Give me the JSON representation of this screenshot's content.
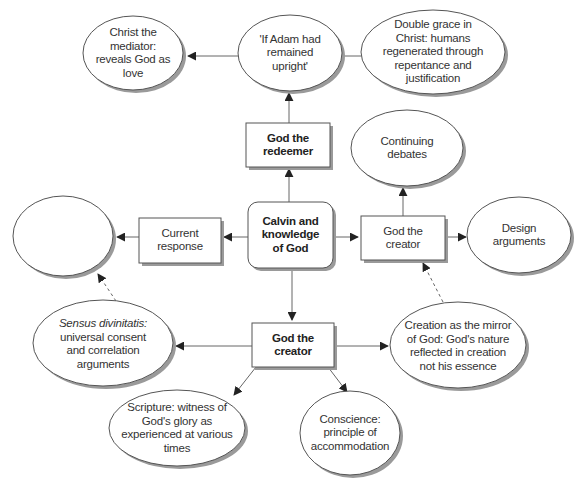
{
  "diagram": {
    "center": {
      "id": "calvin",
      "label": "Calvin and knowledge of God",
      "shape": "rounded-box",
      "bold": true
    },
    "nodes": [
      {
        "id": "redeemer",
        "label": "God the redeemer",
        "shape": "box",
        "bold": true
      },
      {
        "id": "creator",
        "label": "God the creator",
        "shape": "box",
        "bold": true
      },
      {
        "id": "current",
        "label": "Current response",
        "shape": "box"
      },
      {
        "id": "continuing",
        "label": "Continuing debates",
        "shape": "box"
      },
      {
        "id": "mediator",
        "label": "Christ the mediator: reveals God as love",
        "shape": "ellipse"
      },
      {
        "id": "adam",
        "label": "'If Adam had remained upright'",
        "shape": "ellipse"
      },
      {
        "id": "double_grace",
        "label": "Double grace in Christ: humans regenerated through repentance and justification",
        "shape": "ellipse"
      },
      {
        "id": "barth",
        "label": "Barth–Brunner debate",
        "shape": "ellipse"
      },
      {
        "id": "reformed",
        "label": "Reformed epistemology: basic beliefs",
        "shape": "ellipse"
      },
      {
        "id": "design",
        "label": "Design arguments",
        "shape": "ellipse"
      },
      {
        "id": "sensus",
        "label_italic": "Sensus divinitatis:",
        "label_rest": "universal consent and correlation arguments",
        "shape": "ellipse"
      },
      {
        "id": "mirror",
        "label": "Creation as the mirror of God: God's nature reflected in creation not his essence",
        "shape": "ellipse"
      },
      {
        "id": "scripture",
        "label": "Scripture: witness of God's glory as experienced at various times",
        "shape": "ellipse"
      },
      {
        "id": "conscience",
        "label": "Conscience: principle of accommodation",
        "shape": "ellipse"
      }
    ],
    "edges": [
      {
        "from": "calvin",
        "to": "redeemer",
        "style": "solid"
      },
      {
        "from": "redeemer",
        "to": "adam",
        "style": "solid"
      },
      {
        "from": "adam",
        "to": "mediator",
        "style": "solid"
      },
      {
        "from": "adam",
        "to": "double_grace",
        "style": "solid"
      },
      {
        "from": "calvin",
        "to": "current",
        "style": "solid"
      },
      {
        "from": "current",
        "to": "reformed",
        "style": "solid"
      },
      {
        "from": "calvin",
        "to": "continuing",
        "style": "solid"
      },
      {
        "from": "continuing",
        "to": "barth",
        "style": "solid"
      },
      {
        "from": "continuing",
        "to": "design",
        "style": "solid"
      },
      {
        "from": "calvin",
        "to": "creator",
        "style": "solid"
      },
      {
        "from": "creator",
        "to": "sensus",
        "style": "solid"
      },
      {
        "from": "creator",
        "to": "mirror",
        "style": "solid"
      },
      {
        "from": "creator",
        "to": "scripture",
        "style": "solid"
      },
      {
        "from": "creator",
        "to": "conscience",
        "style": "solid"
      },
      {
        "from": "sensus",
        "to": "reformed",
        "style": "dashed"
      },
      {
        "from": "mirror",
        "to": "continuing",
        "style": "dashed"
      }
    ],
    "colors": {
      "stroke": "#555555",
      "shadow": "#9a9a9a",
      "fill": "#ffffff",
      "text": "#333333"
    }
  }
}
